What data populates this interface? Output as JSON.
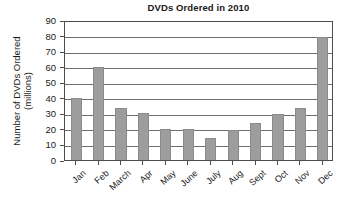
{
  "chart_data": {
    "type": "bar",
    "title": "DVDs Ordered in 2010",
    "xlabel": "",
    "ylabel": "Number of DVDs Ordered (millions)",
    "ylabel_lines": [
      "Number of DVDs Ordered",
      "(millions)"
    ],
    "categories": [
      "Jan",
      "Feb",
      "March",
      "Apr",
      "May",
      "June",
      "July",
      "Aug",
      "Sept",
      "Oct",
      "Nov",
      "Dec"
    ],
    "values": [
      40,
      60,
      33.5,
      30,
      20,
      20,
      14,
      19.5,
      24,
      29.5,
      33.5,
      79
    ],
    "ylim": [
      0,
      90
    ],
    "ytick_step": 10,
    "ytick_labels": [
      "0",
      "10",
      "20",
      "30",
      "40",
      "50",
      "60",
      "70",
      "80",
      "90"
    ],
    "grid": true,
    "grid_axis": "y",
    "legend": false,
    "legend_position": "none",
    "bar_color": "#9d9d9d",
    "bar_edge_color": "#8a8a8a",
    "axis_color": "#4d4d4d",
    "grid_color": "#6e6e6e",
    "text_color": "#1a1a1a",
    "background_color": "#ffffff"
  }
}
